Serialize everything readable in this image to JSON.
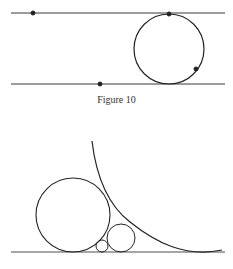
{
  "figure_top": {
    "caption": "Figure 10",
    "lines": [
      {
        "x1": 11,
        "y1": 13,
        "x2": 225,
        "y2": 13
      },
      {
        "x1": 11,
        "y1": 84,
        "x2": 225,
        "y2": 84
      }
    ],
    "circle": {
      "cx": 169,
      "cy": 49,
      "r": 35
    },
    "points": [
      {
        "x": 33,
        "y": 13
      },
      {
        "x": 169,
        "y": 14
      },
      {
        "x": 196,
        "y": 69
      },
      {
        "x": 100,
        "y": 84
      }
    ]
  },
  "figure_bottom": {
    "baseline": {
      "x1": 11,
      "y1": 252,
      "x2": 225,
      "y2": 252
    },
    "circles": [
      {
        "cx": 73,
        "cy": 215,
        "r": 37
      },
      {
        "cx": 121,
        "cy": 238,
        "r": 14
      },
      {
        "cx": 102,
        "cy": 246,
        "r": 6
      }
    ],
    "arc": "M92,141 C96,175 108,205 130,222 C155,242 185,258 222,250"
  },
  "colors": {
    "stroke": "#222222"
  }
}
